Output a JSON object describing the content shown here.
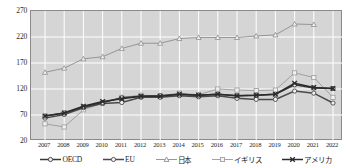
{
  "chart_data": {
    "type": "line",
    "title": "",
    "subtitle": "",
    "xlabel": "",
    "ylabel": "",
    "grid": true,
    "legend_position": "bottom",
    "categories": [
      "2007",
      "2008",
      "2009",
      "2010",
      "2011",
      "2012",
      "2013",
      "2014",
      "2015",
      "2016",
      "2017",
      "2018",
      "2019",
      "2020",
      "2021",
      "2022"
    ],
    "ylim": [
      20,
      270
    ],
    "yticks": [
      20,
      70,
      120,
      170,
      220,
      270
    ],
    "series": [
      {
        "name": "OECD",
        "marker": "circle-open",
        "color": "#3a3a3a",
        "values": [
          68,
          74,
          86,
          94,
          103,
          106,
          107,
          110,
          108,
          110,
          107,
          108,
          110,
          128,
          122,
          121
        ]
      },
      {
        "name": "EU",
        "marker": "circle-open",
        "color": "#4a4a4a",
        "values": [
          64,
          71,
          84,
          92,
          94,
          104,
          104,
          107,
          105,
          107,
          102,
          100,
          100,
          116,
          112,
          93
        ]
      },
      {
        "name": "日本",
        "marker": "triangle-open",
        "color": "#8d8d8d",
        "values": [
          152,
          160,
          178,
          182,
          198,
          208,
          208,
          217,
          219,
          219,
          219,
          222,
          224,
          245,
          244,
          null
        ]
      },
      {
        "name": "イギリス",
        "marker": "square-open",
        "color": "#9a9a9a",
        "values": [
          53,
          47,
          80,
          93,
          104,
          108,
          107,
          112,
          109,
          120,
          118,
          117,
          118,
          151,
          142,
          104
        ]
      },
      {
        "name": "アメリカ",
        "marker": "x-cross",
        "color": "#2b2b2b",
        "values": [
          68,
          74,
          87,
          96,
          101,
          106,
          106,
          110,
          108,
          110,
          107,
          108,
          110,
          131,
          123,
          121
        ]
      }
    ]
  },
  "legend": {
    "items": [
      {
        "label": "OECD",
        "marker": "circle-open"
      },
      {
        "label": "EU",
        "marker": "circle-open"
      },
      {
        "label": "日本",
        "marker": "triangle-open"
      },
      {
        "label": "イギリス",
        "marker": "square-open"
      },
      {
        "label": "アメリカ",
        "marker": "x-cross"
      }
    ]
  },
  "colors": {
    "plot_background": "#d5d5d5",
    "gridline": "#ffffff",
    "axis": "#8a8a8a",
    "page_background": "#ffffff",
    "text": "#2a2a2a"
  }
}
